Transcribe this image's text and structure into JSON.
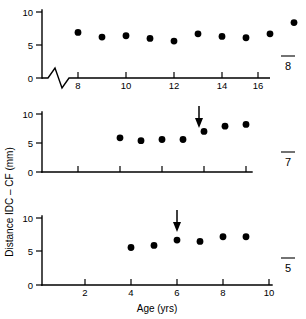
{
  "figure": {
    "y_axis_label": "Distance IDC – CF (mm)",
    "x_axis_label": "Age (yrs)",
    "axis_break_note": "zigzag break on top panel x-axis"
  },
  "panels": [
    {
      "id": "8",
      "id_overbar": true,
      "y_ticks": [
        "0",
        "5",
        "10"
      ],
      "x_ticks": [
        "8",
        "10",
        "12",
        "14",
        "16",
        "18"
      ],
      "x_ticks_visible": true,
      "arrow": null,
      "has_break": true
    },
    {
      "id": "7",
      "id_overbar": true,
      "y_ticks": [
        "0",
        "5",
        "10"
      ],
      "x_ticks": [
        "8",
        "10",
        "12",
        "14",
        "16",
        "18"
      ],
      "x_ticks_visible": false,
      "arrow": {
        "x": 15.0,
        "label": ""
      },
      "has_break": false
    },
    {
      "id": "5",
      "id_overbar": true,
      "y_ticks": [
        "0",
        "5",
        "10"
      ],
      "x_ticks": [
        "2",
        "4",
        "6",
        "8",
        "10"
      ],
      "x_ticks_visible": true,
      "arrow": {
        "x": 6.0,
        "label": ""
      },
      "has_break": false
    }
  ],
  "chart_data": {
    "type": "scatter",
    "title": "",
    "xlabel": "Age (yrs)",
    "ylabel": "Distance IDC – CF (mm)",
    "grid": false,
    "legend": false,
    "marker": "filled-circle",
    "marker_color": "#000000",
    "panel_layout": "3 stacked panels sharing y-axis label",
    "series": [
      {
        "name": "8",
        "panel": 1,
        "xlim": [
          6.6,
          19.0
        ],
        "ylim": [
          0,
          10.8
        ],
        "x": [
          8,
          9,
          10,
          11,
          12,
          13,
          14,
          15,
          16,
          17
        ],
        "y": [
          6.9,
          6.2,
          6.4,
          6.0,
          5.6,
          6.7,
          6.3,
          6.1,
          6.7,
          8.4
        ],
        "annotations": []
      },
      {
        "name": "7",
        "panel": 2,
        "xlim": [
          6.6,
          19.0
        ],
        "ylim": [
          0,
          10.8
        ],
        "x": [
          10,
          11,
          12,
          13,
          14,
          15,
          16
        ],
        "y": [
          5.9,
          5.4,
          5.6,
          5.6,
          7.0,
          7.9,
          8.2
        ],
        "annotations": [
          {
            "type": "arrow",
            "x": 15.0,
            "y": 10.0,
            "direction": "down"
          }
        ]
      },
      {
        "name": "5",
        "panel": 3,
        "xlim": [
          0.4,
          10.6
        ],
        "ylim": [
          0,
          10.8
        ],
        "x": [
          4,
          5,
          6,
          7,
          8,
          9
        ],
        "y": [
          5.6,
          5.9,
          6.7,
          6.5,
          7.2,
          7.2
        ],
        "annotations": [
          {
            "type": "arrow",
            "x": 6.0,
            "y": 10.0,
            "direction": "down"
          }
        ]
      }
    ]
  }
}
